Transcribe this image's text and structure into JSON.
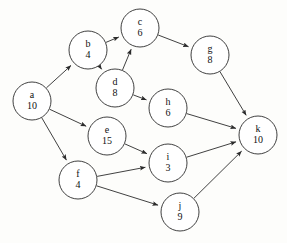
{
  "diagram": {
    "type": "directed-graph",
    "background_color": "#fdfdfb",
    "stroke_color": "#2b2b2b",
    "node_fill_color": "#ffffff",
    "text_color": "#111111",
    "node_radius": 19,
    "nodes": [
      {
        "id": "a",
        "label": "a",
        "value": "10",
        "cx": 32,
        "cy": 101
      },
      {
        "id": "b",
        "label": "b",
        "value": "4",
        "cx": 88,
        "cy": 50
      },
      {
        "id": "c",
        "label": "c",
        "value": "6",
        "cx": 140,
        "cy": 28
      },
      {
        "id": "d",
        "label": "d",
        "value": "8",
        "cx": 115,
        "cy": 88
      },
      {
        "id": "e",
        "label": "e",
        "value": "15",
        "cx": 107,
        "cy": 136
      },
      {
        "id": "f",
        "label": "f",
        "value": "4",
        "cx": 78,
        "cy": 180
      },
      {
        "id": "g",
        "label": "g",
        "value": "8",
        "cx": 210,
        "cy": 55
      },
      {
        "id": "h",
        "label": "h",
        "value": "6",
        "cx": 168,
        "cy": 108
      },
      {
        "id": "i",
        "label": "i",
        "value": "3",
        "cx": 168,
        "cy": 163
      },
      {
        "id": "j",
        "label": "j",
        "value": "9",
        "cx": 180,
        "cy": 212
      },
      {
        "id": "k",
        "label": "k",
        "value": "10",
        "cx": 258,
        "cy": 135
      }
    ],
    "edges": [
      {
        "from": "a",
        "to": "b"
      },
      {
        "from": "a",
        "to": "e"
      },
      {
        "from": "a",
        "to": "f"
      },
      {
        "from": "b",
        "to": "c"
      },
      {
        "from": "b",
        "to": "d"
      },
      {
        "from": "d",
        "to": "c"
      },
      {
        "from": "c",
        "to": "g"
      },
      {
        "from": "d",
        "to": "h"
      },
      {
        "from": "e",
        "to": "i"
      },
      {
        "from": "f",
        "to": "i"
      },
      {
        "from": "f",
        "to": "j"
      },
      {
        "from": "g",
        "to": "k"
      },
      {
        "from": "h",
        "to": "k"
      },
      {
        "from": "i",
        "to": "k"
      },
      {
        "from": "j",
        "to": "k"
      }
    ]
  }
}
